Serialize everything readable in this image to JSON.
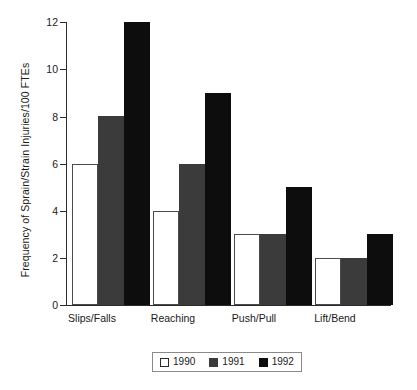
{
  "chart_data": {
    "type": "bar",
    "title": "",
    "xlabel": "",
    "ylabel": "Frequency of Sprain/Strain Injuries/100 FTEs",
    "categories": [
      "Slips/Falls",
      "Reaching",
      "Push/Pull",
      "Lift/Bend"
    ],
    "series": [
      {
        "name": "1990",
        "color": "#ffffff",
        "values": [
          6,
          4,
          3,
          2
        ]
      },
      {
        "name": "1991",
        "color": "#3b3b3b",
        "values": [
          8,
          6,
          3,
          2
        ]
      },
      {
        "name": "1992",
        "color": "#0d0d0d",
        "values": [
          12,
          9,
          5,
          3
        ]
      }
    ],
    "ylim": [
      0,
      12
    ],
    "yticks": [
      0,
      2,
      4,
      6,
      8,
      10,
      12
    ],
    "ytick_labels": [
      "0",
      "2",
      "4",
      "6",
      "8",
      "10",
      "12"
    ],
    "grid": false,
    "legend_position": "bottom",
    "legend_entries": [
      "1990",
      "1991",
      "1992"
    ]
  },
  "axes": {
    "y_title": "Frequency of Sprain/Strain Injuries/100 FTEs",
    "tick_0": "0",
    "tick_2": "2",
    "tick_4": "4",
    "tick_6": "6",
    "tick_8": "8",
    "tick_10": "10",
    "tick_12": "12"
  },
  "categories": {
    "c0": "Slips/Falls",
    "c1": "Reaching",
    "c2": "Push/Pull",
    "c3": "Lift/Bend"
  },
  "legend": {
    "item0": "1990",
    "item1": "1991",
    "item2": "1992"
  }
}
